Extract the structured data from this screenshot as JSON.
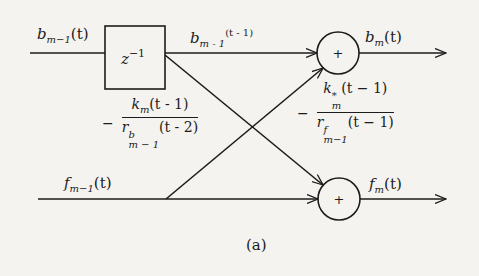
{
  "diagram": {
    "type": "lattice-filter-stage",
    "caption": "(a)",
    "delay_block": {
      "label_base": "z",
      "label_exp": "−1"
    },
    "adders": [
      {
        "id": "top",
        "symbol": "+"
      },
      {
        "id": "bottom",
        "symbol": "+"
      }
    ],
    "signals": {
      "b_in": {
        "base": "b",
        "sub": "m−1",
        "arg": "(t)"
      },
      "b_delayed": {
        "base": "b",
        "sub": "m - 1",
        "sup": "(t - 1)"
      },
      "b_out": {
        "base": "b",
        "sub": "m",
        "arg": "(t)"
      },
      "f_in": {
        "base": "f",
        "sub": "m−1",
        "arg": "(t)"
      },
      "f_out": {
        "base": "f",
        "sub": "m",
        "arg": "(t)"
      }
    },
    "gains": {
      "cross_b_to_f": {
        "sign": "−",
        "numerator": {
          "base": "k",
          "sub": "m",
          "arg": "(t - 1)"
        },
        "denominator": {
          "base": "r",
          "sup": "b",
          "sub": "m − 1",
          "arg": "(t - 2)"
        }
      },
      "cross_f_to_b": {
        "sign": "−",
        "numerator": {
          "base": "k",
          "sup": "*",
          "sub": "m",
          "arg": "(t − 1)"
        },
        "denominator": {
          "base": "r",
          "sup": "f",
          "sub": "m−1",
          "arg": "(t − 1)"
        }
      }
    },
    "colors": {
      "ink": "#1c1c1c",
      "paper": "#f4f3ef"
    }
  }
}
